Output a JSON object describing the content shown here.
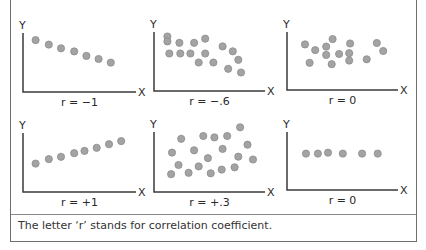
{
  "caption": "The letter ‘r’ stands for correlation coefficient.",
  "axis_labels": {
    "x": "X",
    "y": "Y"
  },
  "colors": {
    "dot_fill": "#a3a3a3",
    "dot_stroke": "#8c8c8c",
    "axis": "#3a3a3a",
    "border": "#6e6e6e"
  },
  "chart_data": [
    {
      "type": "scatter",
      "title": "r = −1",
      "xlabel": "X",
      "ylabel": "Y",
      "xlim": [
        0,
        10
      ],
      "ylim": [
        0,
        10
      ],
      "points": [
        [
          0.6,
          9.3
        ],
        [
          2.0,
          8.3
        ],
        [
          3.3,
          7.5
        ],
        [
          4.7,
          6.8
        ],
        [
          6.0,
          5.8
        ],
        [
          7.3,
          5.1
        ],
        [
          8.6,
          4.3
        ]
      ]
    },
    {
      "type": "scatter",
      "title": "r = −.6",
      "xlabel": "X",
      "ylabel": "Y",
      "xlim": [
        0,
        10
      ],
      "ylim": [
        0,
        10
      ],
      "points": [
        [
          0.7,
          9.9
        ],
        [
          0.7,
          8.8
        ],
        [
          2.0,
          8.5
        ],
        [
          3.6,
          8.5
        ],
        [
          4.8,
          9.4
        ],
        [
          0.9,
          6.1
        ],
        [
          2.1,
          6.1
        ],
        [
          3.2,
          6.1
        ],
        [
          4.8,
          6.1
        ],
        [
          4.1,
          4.1
        ],
        [
          5.7,
          4.1
        ],
        [
          6.7,
          7.7
        ],
        [
          7.8,
          6.6
        ],
        [
          8.4,
          4.7
        ],
        [
          7.3,
          2.7
        ],
        [
          8.7,
          1.9
        ]
      ]
    },
    {
      "type": "scatter",
      "title": "r = 0",
      "xlabel": "X",
      "ylabel": "Y",
      "xlim": [
        0,
        10
      ],
      "ylim": [
        0,
        10
      ],
      "points": [
        [
          1.2,
          8.1
        ],
        [
          2.3,
          6.8
        ],
        [
          3.5,
          7.6
        ],
        [
          4.2,
          9.3
        ],
        [
          3.5,
          5.7
        ],
        [
          4.9,
          5.9
        ],
        [
          6.1,
          8.3
        ],
        [
          6.0,
          6.1
        ],
        [
          6.0,
          4.4
        ],
        [
          1.7,
          3.9
        ],
        [
          4.1,
          3.6
        ],
        [
          7.9,
          4.7
        ],
        [
          9.0,
          8.4
        ],
        [
          9.7,
          6.6
        ]
      ]
    },
    {
      "type": "scatter",
      "title": "r = +1",
      "xlabel": "X",
      "ylabel": "Y",
      "xlim": [
        0,
        10
      ],
      "ylim": [
        0,
        10
      ],
      "points": [
        [
          0.6,
          4.1
        ],
        [
          2.0,
          5.1
        ],
        [
          3.3,
          5.6
        ],
        [
          4.7,
          6.4
        ],
        [
          5.8,
          6.9
        ],
        [
          7.1,
          7.6
        ],
        [
          8.4,
          8.4
        ],
        [
          9.7,
          9.1
        ]
      ]
    },
    {
      "type": "scatter",
      "title": "r = +.3",
      "xlabel": "X",
      "ylabel": "Y",
      "xlim": [
        0,
        10
      ],
      "ylim": [
        0,
        10
      ],
      "points": [
        [
          2.2,
          9.4
        ],
        [
          4.6,
          10.0
        ],
        [
          5.8,
          9.7
        ],
        [
          7.2,
          10.0
        ],
        [
          8.6,
          11.9
        ],
        [
          1.2,
          6.4
        ],
        [
          3.6,
          6.9
        ],
        [
          6.7,
          7.2
        ],
        [
          9.4,
          8.1
        ],
        [
          1.9,
          3.7
        ],
        [
          5.1,
          5.2
        ],
        [
          8.4,
          5.5
        ],
        [
          10.0,
          4.9
        ],
        [
          1.1,
          1.7
        ],
        [
          3.0,
          2.0
        ],
        [
          4.1,
          3.4
        ],
        [
          5.4,
          1.9
        ],
        [
          6.6,
          2.7
        ],
        [
          8.0,
          3.2
        ]
      ]
    },
    {
      "type": "scatter",
      "title": "r = 0",
      "xlabel": "X",
      "ylabel": "Y",
      "xlim": [
        0,
        10
      ],
      "ylim": [
        0,
        10
      ],
      "points": [
        [
          1.3,
          6.0
        ],
        [
          2.6,
          6.0
        ],
        [
          3.7,
          6.2
        ],
        [
          5.3,
          6.0
        ],
        [
          7.4,
          6.0
        ],
        [
          9.1,
          6.0
        ]
      ]
    }
  ]
}
